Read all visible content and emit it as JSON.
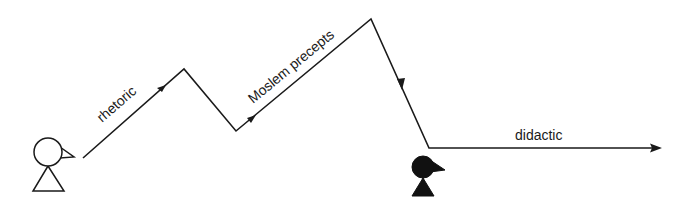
{
  "diagram": {
    "type": "communication-path",
    "labels": {
      "segment1": "rhetoric",
      "segment2": "Moslem precepts",
      "segment3": "didactic"
    },
    "figures": {
      "sender": {
        "style": "outline",
        "description": "open (unfilled) figure, beak facing right"
      },
      "receiver": {
        "style": "filled",
        "description": "solid black figure, beak facing right"
      }
    },
    "path_points": [
      [
        83,
        158
      ],
      [
        184,
        69
      ],
      [
        236,
        131
      ],
      [
        371,
        19
      ],
      [
        429,
        148
      ],
      [
        662,
        148
      ]
    ],
    "colors": {
      "line": "#1a1a1a",
      "background": "#ffffff",
      "receiver_fill": "#111111"
    }
  }
}
